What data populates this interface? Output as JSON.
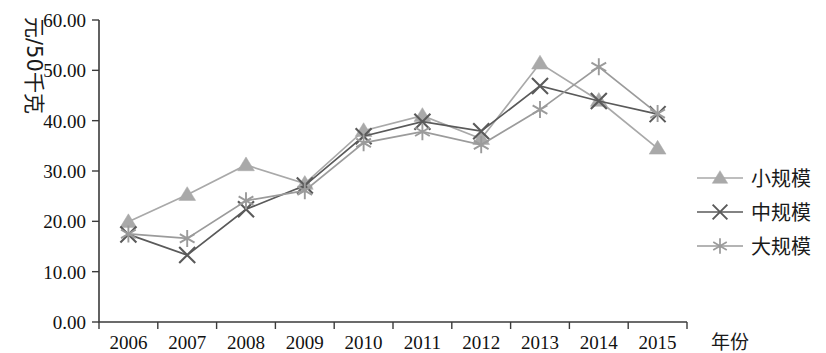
{
  "chart_data": {
    "type": "line",
    "title": "",
    "xlabel": "年份",
    "ylabel": "元/50千克",
    "categories": [
      "2006",
      "2007",
      "2008",
      "2009",
      "2010",
      "2011",
      "2012",
      "2013",
      "2014",
      "2015"
    ],
    "ylim": [
      0,
      60
    ],
    "ytick_labels": [
      "0.00",
      "10.00",
      "20.00",
      "30.00",
      "40.00",
      "50.00",
      "60.00"
    ],
    "ytick_values": [
      0,
      10,
      20,
      30,
      40,
      50,
      60
    ],
    "grid": false,
    "legend_position": "right",
    "series": [
      {
        "name": "小规模",
        "marker": "triangle",
        "color": "#a9a9a9",
        "values": [
          19.9,
          25.3,
          31.2,
          27.5,
          38.0,
          41.0,
          36.4,
          51.4,
          44.0,
          34.5
        ]
      },
      {
        "name": "中规模",
        "marker": "x",
        "color": "#5a5a5a",
        "values": [
          17.4,
          13.3,
          22.4,
          27.1,
          36.9,
          39.8,
          37.9,
          46.9,
          43.9,
          41.3
        ]
      },
      {
        "name": "大规模",
        "marker": "asterisk",
        "color": "#9b9b9b",
        "values": [
          17.5,
          16.6,
          24.1,
          26.1,
          35.6,
          37.8,
          35.2,
          42.2,
          50.7,
          41.4
        ]
      }
    ]
  },
  "axes": {
    "y_axis_name": "y-axis",
    "x_axis_name": "x-axis"
  }
}
